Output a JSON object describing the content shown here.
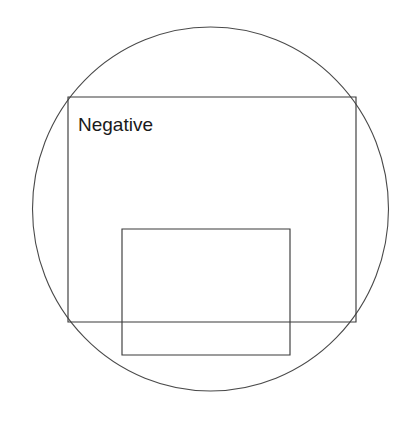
{
  "canvas": {
    "width": 415,
    "height": 422,
    "background_color": "#ffffff"
  },
  "diagram": {
    "stroke_color": "#3b3b3b",
    "circle_stroke_color": "#4a4a4a",
    "labels": [
      {
        "id": "negative-label",
        "text": "Negative",
        "x": 78,
        "y": 131,
        "font_size": 19,
        "color": "#1a1a1a"
      }
    ],
    "shapes": [
      {
        "id": "bounding-circle",
        "type": "circle",
        "cx": 210.5,
        "cy": 209,
        "r": 178,
        "ry": 182,
        "stroke": "#4a4a4a",
        "fill": "none"
      },
      {
        "id": "outer-rectangle",
        "type": "rect",
        "x": 68,
        "y": 97,
        "width": 288,
        "height": 225,
        "stroke": "#3b3b3b",
        "fill": "none"
      },
      {
        "id": "inner-rectangle",
        "type": "rect",
        "x": 122,
        "y": 229,
        "width": 168,
        "height": 126,
        "stroke": "#3b3b3b",
        "fill": "none"
      }
    ]
  }
}
